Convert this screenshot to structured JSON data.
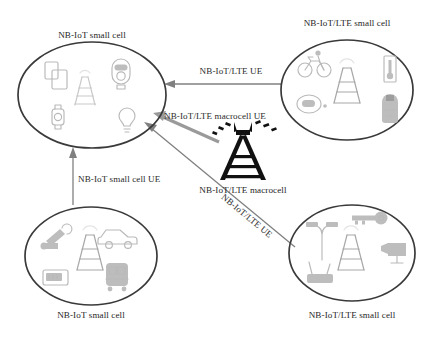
{
  "diagram": {
    "colors": {
      "cell_border": "#3a3a3a",
      "icon_gray": "#bdbdbd",
      "link_gray": "#808080",
      "link_gray_thick": "#9a9a9a",
      "macrocell_black": "#111111",
      "background": "#ffffff"
    },
    "cells": [
      {
        "id": "top-left",
        "label": "NB-IoT small cell",
        "label_position": "above",
        "devices": [
          "tablet-screens-icon",
          "parking-meter-icon",
          "cell-tower-icon",
          "smartwatch-icon",
          "light-bulb-icon"
        ]
      },
      {
        "id": "top-right",
        "label": "NB-IoT/LTE small cell",
        "label_position": "above",
        "devices": [
          "bicycle-icon",
          "cell-tower-icon",
          "thermometer-icon",
          "car-key-fob-icon",
          "backpack-icon"
        ]
      },
      {
        "id": "bottom-left",
        "label": "NB-IoT small cell",
        "label_position": "below",
        "devices": [
          "robot-arm-icon",
          "car-icon",
          "cell-tower-icon",
          "smart-meter-icon",
          "train-icon"
        ]
      },
      {
        "id": "bottom-right",
        "label": "NB-IoT/LTE small cell",
        "label_position": "below",
        "devices": [
          "street-lamp-icon",
          "key-icon",
          "cell-tower-icon",
          "security-camera-icon",
          "router-icon"
        ]
      }
    ],
    "macrocell": {
      "label": "NB-IoT/LTE macrocell",
      "icon": "macrocell-tower-icon"
    },
    "links": [
      {
        "id": "top-right-to-top-left",
        "label": "NB-IoT/LTE UE",
        "from": "top-right",
        "to": "top-left",
        "style": "thin",
        "orientation": "horizontal"
      },
      {
        "id": "macrocell-to-top-left",
        "label": "NB-IoT/LTE macrocell UE",
        "from": "macrocell",
        "to": "top-left",
        "style": "thick",
        "orientation": "diagonal"
      },
      {
        "id": "bottom-left-to-top-left",
        "label": "NB-IoT small cell UE",
        "from": "bottom-left",
        "to": "top-left",
        "style": "thin",
        "orientation": "vertical"
      },
      {
        "id": "bottom-right-to-top-left",
        "label": "NB-IoT/LTE UE",
        "from": "bottom-right",
        "to": "top-left",
        "style": "thin",
        "orientation": "diagonal",
        "label_rotated": true
      }
    ]
  }
}
